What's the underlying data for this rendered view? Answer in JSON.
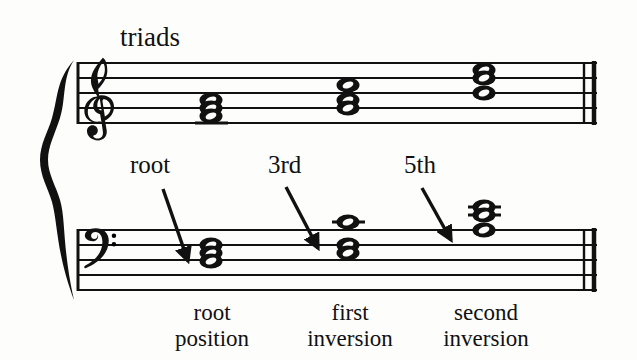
{
  "title": "triads",
  "notation": {
    "clefs": [
      {
        "name": "treble-clef",
        "symbol": "G-clef"
      },
      {
        "name": "bass-clef",
        "symbol": "F-clef"
      }
    ],
    "brace": "grand-staff-brace",
    "barline": "final-double-barline",
    "staff_systems": [
      {
        "name": "treble-staff",
        "line_ys": [
          63,
          78,
          93,
          108,
          123
        ]
      },
      {
        "name": "bass-staff",
        "line_ys": [
          230,
          245,
          260,
          275,
          290
        ]
      }
    ]
  },
  "chord_labels": {
    "pointer_labels": [
      {
        "text": "root",
        "x": 130
      },
      {
        "text": "3rd",
        "x": 268
      },
      {
        "text": "5th",
        "x": 404
      }
    ],
    "bottom_labels": [
      {
        "text": "root\nposition",
        "center_x": 212
      },
      {
        "text": "first\ninversion",
        "center_x": 350
      },
      {
        "text": "second\ninversion",
        "center_x": 485
      }
    ]
  },
  "chord_data": {
    "type": "music-notation",
    "description": "Triad inversions shown on a grand staff",
    "chords": [
      {
        "label": "root position",
        "treble_noteheads_y": [
          100,
          108,
          116
        ],
        "treble_x": 211,
        "treble_ledger_y": [
          123
        ],
        "bass_noteheads_y": [
          245,
          253,
          261
        ],
        "bass_x": 211,
        "bass_ledger_y": [],
        "pointer": "root"
      },
      {
        "label": "first inversion",
        "treble_noteheads_y": [
          85,
          100,
          108
        ],
        "treble_x": 348,
        "treble_ledger_y": [],
        "bass_noteheads_y": [
          222,
          245,
          253
        ],
        "bass_x": 348,
        "bass_ledger_y": [
          222
        ],
        "pointer": "3rd"
      },
      {
        "label": "second inversion",
        "treble_noteheads_y": [
          70,
          78,
          93
        ],
        "treble_x": 484,
        "treble_ledger_y": [],
        "bass_noteheads_y": [
          207,
          215,
          230
        ],
        "bass_x": 484,
        "bass_ledger_y": [
          207,
          215
        ],
        "pointer": "5th"
      }
    ],
    "arrows": [
      {
        "name": "root-arrow",
        "x1": 163,
        "y1": 189,
        "x2": 189,
        "y2": 264
      },
      {
        "name": "third-arrow",
        "x1": 286,
        "y1": 187,
        "x2": 319,
        "y2": 250
      },
      {
        "name": "fifth-arrow",
        "x1": 422,
        "y1": 188,
        "x2": 452,
        "y2": 242
      }
    ]
  },
  "colors": {
    "ink": "#111111",
    "page": "#fdfdfb"
  }
}
